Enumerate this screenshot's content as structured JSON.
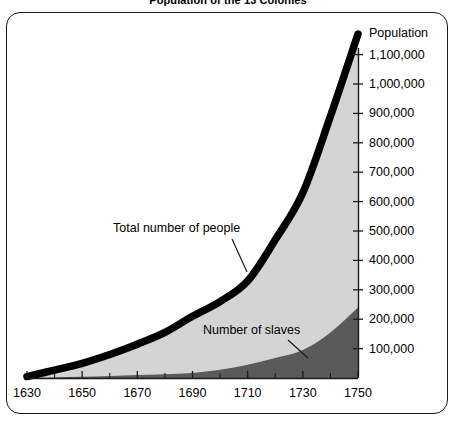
{
  "title": "Population of the 13 Colonies",
  "axes": {
    "y_title": "Population",
    "y_ticks": [
      "100,000",
      "200,000",
      "300,000",
      "400,000",
      "500,000",
      "600,000",
      "700,000",
      "800,000",
      "900,000",
      "1,000,000",
      "1,100,000"
    ],
    "x_ticks": [
      "1630",
      "1650",
      "1670",
      "1690",
      "1710",
      "1730",
      "1750"
    ]
  },
  "annotations": {
    "total": "Total number of people",
    "slaves": "Number of slaves"
  },
  "colors": {
    "total_line": "#000000",
    "total_fill": "#d4d4d4",
    "slaves_fill": "#5a5a5a",
    "frame": "#1a1a1a",
    "background": "#ffffff",
    "axis": "#1a1a1a"
  },
  "chart_data": {
    "type": "area",
    "title": "Population of the 13 Colonies",
    "xlabel": "",
    "ylabel": "Population",
    "xlim": [
      1630,
      1750
    ],
    "ylim": [
      0,
      1200000
    ],
    "grid": false,
    "legend": "none",
    "x": [
      1630,
      1640,
      1650,
      1660,
      1670,
      1680,
      1690,
      1700,
      1710,
      1720,
      1730,
      1740,
      1750
    ],
    "series": [
      {
        "name": "Total number of people",
        "style": "thick black outline over light gray fill",
        "values": [
          5000,
          27000,
          50000,
          80000,
          115000,
          155000,
          210000,
          260000,
          330000,
          470000,
          630000,
          890000,
          1170000
        ]
      },
      {
        "name": "Number of slaves",
        "style": "dark gray filled area",
        "values": [
          0,
          2000,
          4000,
          7000,
          10000,
          13000,
          17000,
          28000,
          45000,
          68000,
          95000,
          155000,
          240000
        ]
      }
    ],
    "annotations": [
      {
        "text": "Total number of people",
        "points_to_series": "Total number of people",
        "points_to_x": 1700
      },
      {
        "text": "Number of slaves",
        "points_to_series": "Number of slaves",
        "points_to_x": 1728
      }
    ]
  }
}
